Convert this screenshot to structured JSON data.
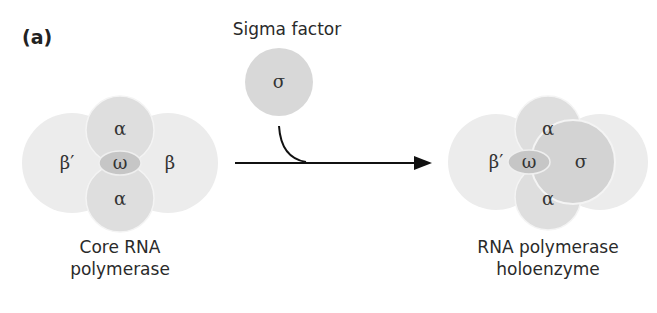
{
  "panel_label": "(a)",
  "sigma_factor": {
    "title": "Sigma factor",
    "symbol": "σ"
  },
  "core": {
    "caption_line1": "Core RNA",
    "caption_line2": "polymerase",
    "subunits": {
      "beta_prime": "β′",
      "beta": "β",
      "alpha_top": "α",
      "alpha_bottom": "α",
      "omega": "ω"
    }
  },
  "holoenzyme": {
    "caption_line1": "RNA polymerase",
    "caption_line2": "holoenzyme",
    "subunits": {
      "beta_prime": "β′",
      "alpha_top": "α",
      "alpha_bottom": "α",
      "omega": "ω",
      "sigma": "σ"
    }
  },
  "colors": {
    "beta_fill": "#ebebeb",
    "alpha_fill": "#dcdcdc",
    "omega_fill": "#c4c4c4",
    "sigma_fill": "#d2d2d2",
    "arrow": "#111111"
  }
}
